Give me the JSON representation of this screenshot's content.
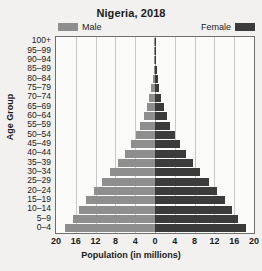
{
  "chart_data": {
    "type": "bar",
    "subtype": "population-pyramid",
    "title": "Nigeria, 2018",
    "xlabel": "Population (in millions)",
    "ylabel": "Age Group",
    "xlim": [
      -20,
      20
    ],
    "xticks": [
      20,
      16,
      12,
      8,
      4,
      0,
      4,
      8,
      12,
      16,
      20
    ],
    "xtick_values": [
      -20,
      -16,
      -12,
      -8,
      -4,
      0,
      4,
      8,
      12,
      16,
      20
    ],
    "grid": true,
    "legend_position": "top",
    "categories": [
      "100+",
      "95–99",
      "90–94",
      "85–89",
      "80–84",
      "75–79",
      "70–74",
      "65–69",
      "60–64",
      "55–59",
      "50–54",
      "45–49",
      "40–44",
      "35–39",
      "30–34",
      "25–29",
      "20–24",
      "15–19",
      "10–14",
      "5–9",
      "0–4"
    ],
    "series": [
      {
        "name": "Male",
        "color": "#8e8e8e",
        "side": "left",
        "values": [
          0.02,
          0.06,
          0.15,
          0.3,
          0.5,
          0.8,
          1.2,
          1.7,
          2.3,
          3.0,
          3.9,
          4.9,
          6.1,
          7.5,
          9.0,
          10.8,
          12.4,
          14.0,
          15.4,
          16.6,
          18.2
        ]
      },
      {
        "name": "Female",
        "color": "#3b3b3b",
        "side": "right",
        "values": [
          0.03,
          0.08,
          0.18,
          0.35,
          0.6,
          0.9,
          1.3,
          1.8,
          2.4,
          3.1,
          4.0,
          5.0,
          6.2,
          7.6,
          9.1,
          10.9,
          12.5,
          14.1,
          15.5,
          16.7,
          18.3
        ]
      }
    ]
  },
  "legend": {
    "male_label": "Male",
    "female_label": "Female",
    "male_color": "#8e8e8e",
    "female_color": "#3b3b3b"
  }
}
